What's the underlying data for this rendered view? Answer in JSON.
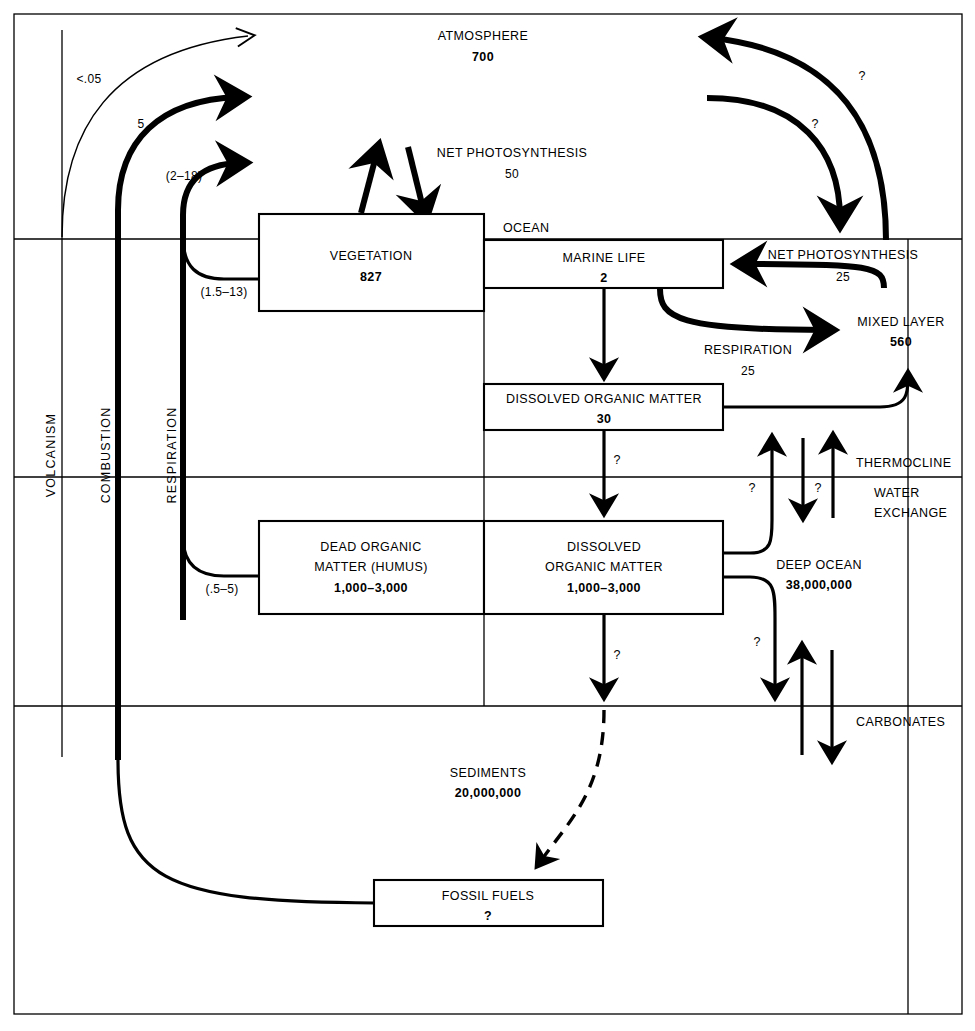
{
  "diagram": {
    "type": "flow-diagram"
  },
  "regions": {
    "atmosphere_label": "ATMOSPHERE",
    "atmosphere_value": "700",
    "land_label": "LAND",
    "ocean_label": "OCEAN",
    "thermocline_label": "THERMOCLINE",
    "water_exchange_line1": "WATER",
    "water_exchange_line2": "EXCHANGE",
    "deep_ocean_label": "DEEP OCEAN",
    "deep_ocean_value": "38,000,000",
    "carbonates_label": "CARBONATES",
    "sediments_label": "SEDIMENTS",
    "sediments_value": "20,000,000",
    "mixed_layer_label": "MIXED LAYER",
    "mixed_layer_value": "560"
  },
  "vertical_labels": {
    "volcanism": "VOLCANISM",
    "combustion": "COMBUSTION",
    "respiration": "RESPIRATION"
  },
  "pools": [
    {
      "name": "vegetation",
      "label": "VEGETATION",
      "value": "827"
    },
    {
      "name": "marine-life",
      "label": "MARINE LIFE",
      "value": "2"
    },
    {
      "name": "dissolved-organic-matter-upper",
      "label": "DISSOLVED ORGANIC MATTER",
      "value": "30"
    },
    {
      "name": "dead-organic-matter",
      "label_line1": "DEAD ORGANIC",
      "label_line2": "MATTER (HUMUS)",
      "value": "1,000–3,000"
    },
    {
      "name": "dissolved-organic-matter-deep",
      "label_line1": "DISSOLVED",
      "label_line2": "ORGANIC MATTER",
      "value": "1,000–3,000"
    },
    {
      "name": "fossil-fuels",
      "label": "FOSSIL FUELS",
      "value": "?"
    }
  ],
  "flows": {
    "volcanism_value": "<.05",
    "combustion_value": "5",
    "respiration_land_value": "(2–18)",
    "vegetation_respiration_value": "(1.5–13)",
    "humus_respiration_value": "(.5–5)",
    "land_respiration_label": "RESPIRATION",
    "land_respiration_value": "50",
    "land_net_photosynthesis_label": "NET PHOTOSYNTHESIS",
    "land_net_photosynthesis_value": "50",
    "ocean_net_photosynthesis_label": "NET PHOTOSYNTHESIS",
    "ocean_net_photosynthesis_value": "25",
    "ocean_respiration_label": "RESPIRATION",
    "ocean_respiration_value": "25",
    "air_sea_uptake_value": "?",
    "air_sea_release_value": "?",
    "doc_sink_upper_value": "?",
    "upwelling_value": "?",
    "downwelling_value": "?",
    "thermocline_exchange_value": "?",
    "deep_doc_sink_value": "?",
    "deep_carbonate_value": "?"
  },
  "colors": {
    "ink": "#000000",
    "paper": "#ffffff"
  }
}
